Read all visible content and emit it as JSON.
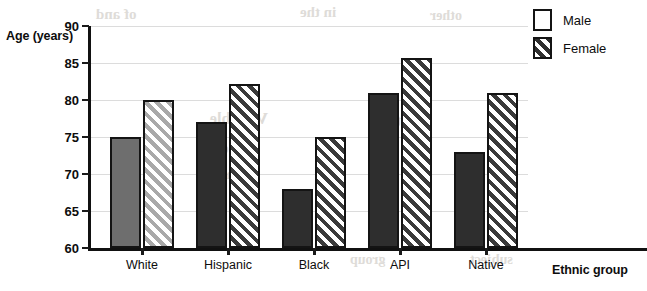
{
  "chart_data": {
    "type": "bar",
    "title": "",
    "subtitle": "",
    "xlabel": "Ethnic group",
    "ylabel": "Age (years)",
    "categories": [
      "White",
      "Hispanic",
      "Black",
      "API",
      "Native"
    ],
    "series": [
      {
        "name": "Male",
        "values": [
          75,
          77,
          68,
          81,
          73
        ]
      },
      {
        "name": "Female",
        "values": [
          80,
          82.2,
          75,
          85.7,
          81
        ]
      }
    ],
    "ylim": [
      60,
      90
    ],
    "yticks": [
      60,
      65,
      70,
      75,
      80,
      85,
      90
    ],
    "ytick_labels": [
      "60",
      "65",
      "70",
      "75",
      "80",
      "85",
      "90"
    ],
    "grid": "horizontal",
    "legend_position": "top-right",
    "bar_colors": {
      "male_light": "#6e6e6e",
      "male_dark": "#2e2e2e",
      "female_light": "#a9a9a9",
      "female_dark": "#3a3a3a",
      "bar_outline": "#141414",
      "gridline": "#dcdcdc",
      "axis": "#111111",
      "text": "#0d0d0d"
    },
    "annotations": []
  },
  "legend": {
    "items": [
      {
        "label": "Male",
        "pattern": "solid"
      },
      {
        "label": "Female",
        "pattern": "diagonal-hatch"
      }
    ]
  },
  "background_bleed": [
    {
      "text": "of  and",
      "x": 96,
      "y": 6,
      "size": 15
    },
    {
      "text": "in the",
      "x": 300,
      "y": 4,
      "size": 15
    },
    {
      "text": "other",
      "x": 430,
      "y": 8,
      "size": 14
    },
    {
      "text": "Variable",
      "x": 210,
      "y": 110,
      "size": 16
    },
    {
      "text": "the",
      "x": 380,
      "y": 112,
      "size": 16
    },
    {
      "text": "of a",
      "x": 205,
      "y": 140,
      "size": 15
    },
    {
      "text": "case",
      "x": 214,
      "y": 166,
      "size": 15
    },
    {
      "text": "group",
      "x": 350,
      "y": 252,
      "size": 14
    },
    {
      "text": "subject",
      "x": 470,
      "y": 252,
      "size": 14
    }
  ]
}
